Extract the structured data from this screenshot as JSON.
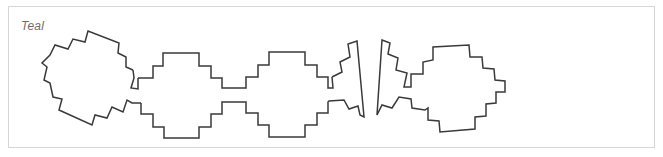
{
  "panel": {
    "label": "Teal",
    "stroke_color": "#3a3a3a",
    "border_color": "#d6d6d6",
    "label_color": "#6e6e6e"
  },
  "shapes": [
    {
      "name": "stepped-blob-1",
      "description": "rotated stepped octagon outline, leftmost"
    },
    {
      "name": "stepped-blob-2",
      "description": "stepped octagon outline"
    },
    {
      "name": "stepped-blob-3",
      "description": "stepped octagon outline"
    },
    {
      "name": "shard-4",
      "description": "narrow slanted fragment with stepped edge"
    },
    {
      "name": "stepped-blob-5",
      "description": "rotated stepped outline with slanted left edge, rightmost"
    }
  ]
}
